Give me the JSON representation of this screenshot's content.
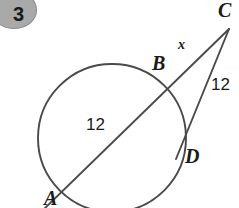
{
  "badge": {
    "number": "3"
  },
  "figure": {
    "type": "geometry-diagram",
    "stroke_color": "#4a4a4a",
    "label_color": "#1a1a1a",
    "badge_color": "#a9a9a9",
    "background_color": "#ffffff",
    "points": {
      "C": "C",
      "B": "B",
      "D": "D",
      "A": "A"
    },
    "measures": {
      "segment_CB": "x",
      "chord_BA": "12",
      "tangent_CD": "12"
    },
    "geometry": {
      "circle": {
        "cx": 112,
        "cy": 138,
        "r": 74
      },
      "vertex_C": {
        "x": 229,
        "y": 29
      },
      "point_B": {
        "x": 163,
        "y": 88
      },
      "point_A": {
        "x": 61,
        "y": 188
      },
      "point_D": {
        "x": 181,
        "y": 141
      }
    }
  }
}
